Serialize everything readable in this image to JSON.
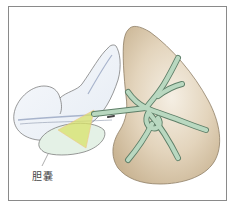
{
  "figure": {
    "type": "anatomical-illustration",
    "labels": {
      "gallbladder": "胆嚢"
    },
    "colors": {
      "frame": "#8a8a8a",
      "liver_fill": "#d9c6a8",
      "liver_highlight": "#f3ece0",
      "liver_outline": "#8f7f66",
      "bile_duct_fill": "#b9d8c0",
      "bile_duct_outline": "#5e7f68",
      "gallbladder_fill": "#e4f1e6",
      "stomach_fill": "#eef2f7",
      "outline": "#6f6f6f",
      "highlight_yellow": "#d8e26a"
    },
    "structures": [
      "liver",
      "bile-ducts",
      "gallbladder",
      "stomach-duodenum",
      "highlighted-triangle"
    ]
  }
}
